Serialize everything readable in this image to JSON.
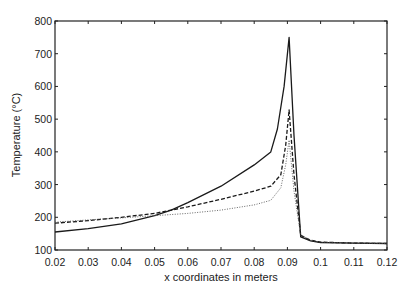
{
  "chart_data": {
    "type": "line",
    "title": "",
    "xlabel": "x coordinates in meters",
    "ylabel": "Temperature (°C)",
    "xlim": [
      0.02,
      0.12
    ],
    "ylim": [
      100,
      800
    ],
    "xticks": [
      "0.02",
      "0.03",
      "0.04",
      "0.05",
      "0.06",
      "0.07",
      "0.08",
      "0.09",
      "0.1",
      "0.11",
      "0.12"
    ],
    "yticks": [
      "100",
      "200",
      "300",
      "400",
      "500",
      "600",
      "700",
      "800"
    ],
    "grid": false,
    "legend": null,
    "series": [
      {
        "name": "solid",
        "style": "solid",
        "x": [
          0.02,
          0.03,
          0.04,
          0.05,
          0.055,
          0.06,
          0.07,
          0.08,
          0.085,
          0.087,
          0.089,
          0.0905,
          0.092,
          0.094,
          0.097,
          0.1,
          0.11,
          0.12
        ],
        "y": [
          155,
          165,
          180,
          205,
          222,
          245,
          295,
          360,
          400,
          470,
          600,
          750,
          450,
          140,
          128,
          123,
          121,
          120
        ]
      },
      {
        "name": "dashed",
        "style": "dashed",
        "x": [
          0.02,
          0.03,
          0.04,
          0.05,
          0.055,
          0.06,
          0.07,
          0.08,
          0.085,
          0.088,
          0.0895,
          0.0905,
          0.092,
          0.094,
          0.097,
          0.1,
          0.11,
          0.12
        ],
        "y": [
          182,
          190,
          200,
          212,
          222,
          232,
          255,
          280,
          295,
          330,
          420,
          528,
          330,
          145,
          130,
          124,
          121,
          120
        ]
      },
      {
        "name": "dotted",
        "style": "dotted",
        "x": [
          0.02,
          0.03,
          0.04,
          0.05,
          0.06,
          0.07,
          0.08,
          0.085,
          0.088,
          0.0895,
          0.0905,
          0.092,
          0.094,
          0.097,
          0.1,
          0.11,
          0.12
        ],
        "y": [
          185,
          192,
          198,
          205,
          212,
          222,
          238,
          252,
          290,
          360,
          436,
          280,
          145,
          130,
          124,
          121,
          120
        ]
      }
    ]
  }
}
